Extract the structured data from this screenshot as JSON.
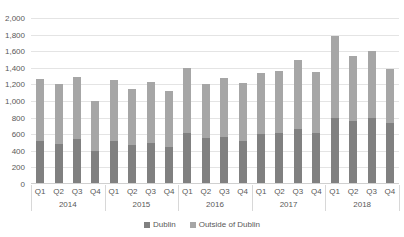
{
  "chart_data": {
    "type": "bar",
    "stacked": true,
    "title": "",
    "subtitle": "",
    "xlabel": "",
    "ylabel": "",
    "ylim": [
      0,
      2000
    ],
    "ytick_step": 200,
    "ytick_labels": [
      "2,000",
      "1,800",
      "1,600",
      "1,400",
      "1,200",
      "1,000",
      "800",
      "600",
      "400",
      "200",
      "0"
    ],
    "ytick_values": [
      2000,
      1800,
      1600,
      1400,
      1200,
      1000,
      800,
      600,
      400,
      200,
      0
    ],
    "grid": true,
    "grid_axis": "y",
    "legend_position": "bottom",
    "categories": [
      "Q1",
      "Q2",
      "Q3",
      "Q4",
      "Q1",
      "Q2",
      "Q3",
      "Q4",
      "Q1",
      "Q2",
      "Q3",
      "Q4",
      "Q1",
      "Q2",
      "Q3",
      "Q4",
      "Q1",
      "Q2",
      "Q3",
      "Q4"
    ],
    "group_labels": [
      "2014",
      "2015",
      "2016",
      "2017",
      "2018"
    ],
    "group_size": 4,
    "series": [
      {
        "name": "Dublin",
        "color": "#808080",
        "values": [
          520,
          480,
          540,
          400,
          520,
          470,
          490,
          450,
          620,
          560,
          570,
          520,
          600,
          620,
          660,
          620,
          800,
          760,
          790,
          740
        ]
      },
      {
        "name": "Outside of Dublin",
        "color": "#a6a6a6",
        "values": [
          740,
          720,
          750,
          600,
          730,
          680,
          740,
          670,
          780,
          650,
          710,
          700,
          740,
          740,
          840,
          730,
          980,
          780,
          810,
          640
        ]
      }
    ],
    "totals": [
      1260,
      1200,
      1290,
      1000,
      1250,
      1150,
      1230,
      1120,
      1400,
      1210,
      1280,
      1220,
      1340,
      1360,
      1500,
      1350,
      1780,
      1540,
      1600,
      1380
    ]
  },
  "legend": {
    "items": [
      {
        "label": "Dublin",
        "color": "#808080"
      },
      {
        "label": "Outside of Dublin",
        "color": "#a6a6a6"
      }
    ]
  }
}
